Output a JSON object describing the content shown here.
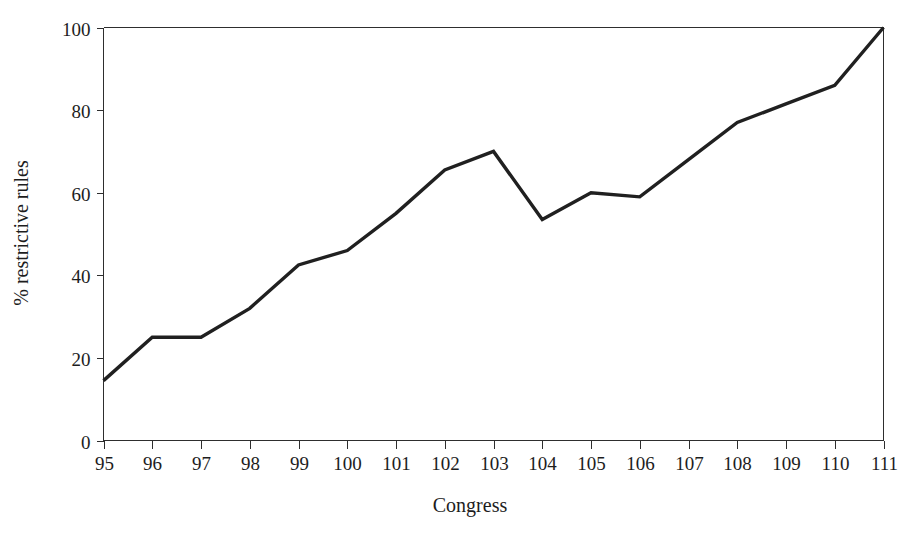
{
  "chart_data": {
    "type": "line",
    "title": "",
    "xlabel": "Congress",
    "ylabel": "% restrictive rules",
    "categories": [
      "95",
      "96",
      "97",
      "98",
      "99",
      "100",
      "101",
      "102",
      "103",
      "104",
      "105",
      "106",
      "107",
      "108",
      "109",
      "110",
      "111"
    ],
    "x": [
      95,
      96,
      97,
      98,
      99,
      100,
      101,
      102,
      103,
      104,
      105,
      106,
      107,
      108,
      109,
      110,
      111
    ],
    "values": [
      14.5,
      25,
      25,
      32,
      42.5,
      46,
      55,
      65.5,
      70,
      53.5,
      60,
      59,
      68,
      77,
      81.5,
      86,
      100
    ],
    "series": [
      {
        "name": "% restrictive rules",
        "values": [
          14.5,
          25,
          25,
          32,
          42.5,
          46,
          55,
          65.5,
          70,
          53.5,
          60,
          59,
          68,
          77,
          81.5,
          86,
          100
        ]
      }
    ],
    "xlim": [
      95,
      111
    ],
    "ylim": [
      0,
      100
    ],
    "ytick_labels": [
      "0",
      "20",
      "40",
      "60",
      "80",
      "100"
    ],
    "yticks": [
      0,
      20,
      40,
      60,
      80,
      100
    ],
    "xtick_labels": [
      "95",
      "96",
      "97",
      "98",
      "99",
      "100",
      "101",
      "102",
      "103",
      "104",
      "105",
      "106",
      "107",
      "108",
      "109",
      "110",
      "111"
    ],
    "grid": false,
    "legend": false,
    "legend_position": "none",
    "line_color": "#202020",
    "axis_color": "#2e2e2e",
    "background_color": "#ffffff"
  }
}
